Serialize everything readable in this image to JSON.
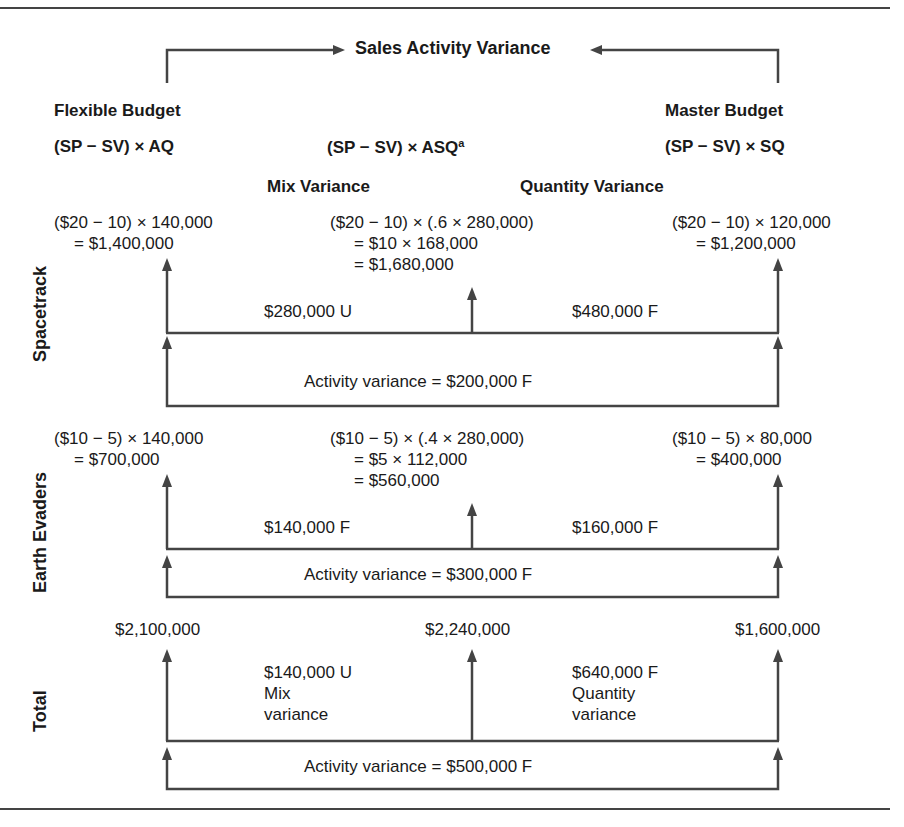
{
  "title": "Sales Activity Variance",
  "columns": {
    "left": {
      "heading": "Flexible Budget",
      "formula": "(SP − SV) × AQ"
    },
    "middle": {
      "formula": "(SP − SV) × ASQ",
      "footnote_mark": "a"
    },
    "right": {
      "heading": "Master Budget",
      "formula": "(SP − SV) × SQ"
    }
  },
  "variance_headers": {
    "mix": "Mix Variance",
    "quantity": "Quantity Variance"
  },
  "rows": [
    {
      "label": "Spacetrack",
      "left": [
        "($20 − 10) × 140,000",
        "= $1,400,000"
      ],
      "middle": [
        "($20 − 10) × (.6 × 280,000)",
        "= $10 × 168,000",
        "= $1,680,000"
      ],
      "right": [
        "($20 − 10) × 120,000",
        "= $1,200,000"
      ],
      "mix_variance": "$280,000 U",
      "quantity_variance": "$480,000 F",
      "activity_variance": "Activity variance = $200,000 F"
    },
    {
      "label": "Earth Evaders",
      "left": [
        "($10 − 5) × 140,000",
        "= $700,000"
      ],
      "middle": [
        "($10 − 5) × (.4 × 280,000)",
        "= $5 × 112,000",
        "= $560,000"
      ],
      "right": [
        "($10 − 5) × 80,000",
        "= $400,000"
      ],
      "mix_variance": "$140,000 F",
      "quantity_variance": "$160,000 F",
      "activity_variance": "Activity variance = $300,000 F"
    },
    {
      "label": "Total",
      "left": [
        "$2,100,000"
      ],
      "middle": [
        "$2,240,000"
      ],
      "right": [
        "$1,600,000"
      ],
      "mix_variance": "$140,000 U",
      "mix_variance_note": [
        "Mix",
        "variance"
      ],
      "quantity_variance": "$640,000 F",
      "quantity_variance_note": [
        "Quantity",
        "variance"
      ],
      "activity_variance": "Activity variance = $500,000 F"
    }
  ],
  "colors": {
    "line": "#444444",
    "text": "#1a1a1a",
    "background": "#ffffff"
  }
}
